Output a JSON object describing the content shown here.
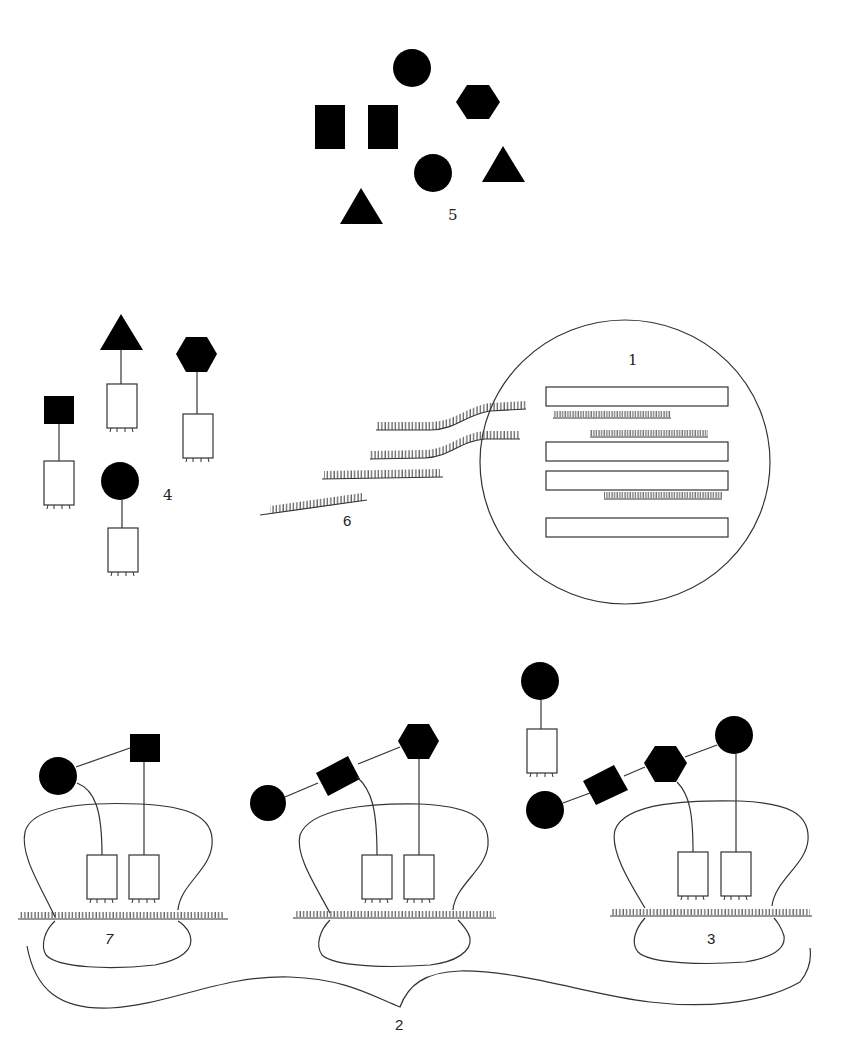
{
  "diagram": {
    "colors": {
      "ink": "#000000",
      "line": "#333333",
      "background": "#ffffff"
    },
    "labels": {
      "label_1": "1",
      "label_2": "2",
      "label_3": "3",
      "label_4": "4",
      "label_5": "5",
      "label_6": "6",
      "label_7": "7"
    },
    "groups": [
      {
        "id": "5",
        "description": "free shapes",
        "shapes": [
          "circle",
          "hexagon",
          "rectangle",
          "rectangle",
          "circle",
          "triangle",
          "triangle"
        ]
      },
      {
        "id": "4",
        "description": "shape-tethered boxes",
        "shapes": [
          "square",
          "triangle",
          "hexagon",
          "circle"
        ]
      },
      {
        "id": "1",
        "description": "circle containing 4 bars and 3 hatched strands"
      },
      {
        "id": "6",
        "description": "4 hatched strands entering circle 1"
      },
      {
        "id": "7",
        "description": "complex with circle-square chain"
      },
      {
        "id": "3",
        "description": "complex with circle-rect-hexagon-circle chain"
      },
      {
        "id": "2",
        "description": "brace spanning the three complexes"
      }
    ]
  }
}
